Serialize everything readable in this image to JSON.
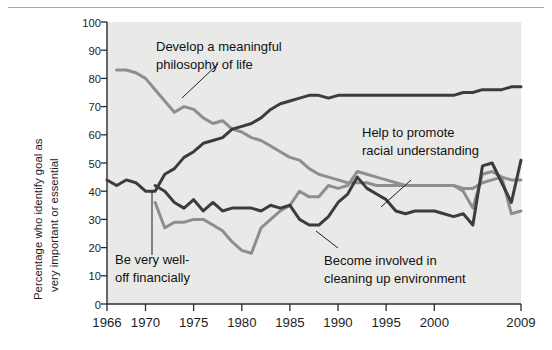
{
  "chart_data": {
    "type": "line",
    "title": "",
    "xlabel": "",
    "ylabel": "Percentage who identify goal as very important or essential",
    "ylabel_line1": "Percentage who identify goal as",
    "ylabel_line2": "very important or essential",
    "xlim": [
      1966,
      2009
    ],
    "ylim": [
      0,
      100
    ],
    "grid": false,
    "legend_position": "inline-annotations",
    "y_ticks": [
      "0",
      "10",
      "20",
      "30",
      "40",
      "50",
      "60",
      "70",
      "80",
      "90",
      "100"
    ],
    "y_tick_values": [
      0,
      10,
      20,
      30,
      40,
      50,
      60,
      70,
      80,
      90,
      100
    ],
    "x_ticks": [
      "1966",
      "1970",
      "1975",
      "1980",
      "1985",
      "1990",
      "1995",
      "2000",
      "2009"
    ],
    "x_tick_values": [
      1966,
      1970,
      1975,
      1980,
      1985,
      1990,
      1995,
      2000,
      2009
    ],
    "series": [
      {
        "name": "Develop a meaningful philosophy of life",
        "color": "#8e8e8e",
        "x": [
          1967,
          1968,
          1969,
          1970,
          1971,
          1972,
          1973,
          1974,
          1975,
          1976,
          1977,
          1978,
          1979,
          1980,
          1981,
          1982,
          1983,
          1984,
          1985,
          1986,
          1987,
          1988,
          1989,
          1990,
          1991,
          1992,
          1993,
          1994,
          1995,
          1996,
          1997,
          1998,
          1999,
          2000,
          2001,
          2002,
          2003,
          2004,
          2005,
          2006,
          2007,
          2008,
          2009
        ],
        "values": [
          83,
          83,
          82,
          80,
          76,
          72,
          68,
          70,
          69,
          66,
          64,
          65,
          62,
          61,
          59,
          58,
          56,
          54,
          52,
          51,
          48,
          46,
          45,
          44,
          43,
          43,
          43,
          42,
          42,
          42,
          42,
          42,
          42,
          42,
          42,
          42,
          41,
          41,
          43,
          44,
          45,
          44,
          44
        ]
      },
      {
        "name": "Be very well-off financially",
        "color": "#3c3c3c",
        "x": [
          1966,
          1967,
          1968,
          1969,
          1970,
          1971,
          1972,
          1973,
          1974,
          1975,
          1976,
          1977,
          1978,
          1979,
          1980,
          1981,
          1982,
          1983,
          1984,
          1985,
          1986,
          1987,
          1988,
          1989,
          1990,
          1991,
          1992,
          1993,
          1994,
          1995,
          1996,
          1997,
          1998,
          1999,
          2000,
          2001,
          2002,
          2003,
          2004,
          2005,
          2006,
          2007,
          2008,
          2009
        ],
        "values": [
          44,
          42,
          44,
          43,
          40,
          40,
          46,
          48,
          52,
          54,
          57,
          58,
          59,
          62,
          63,
          64,
          66,
          69,
          71,
          72,
          73,
          74,
          74,
          73,
          74,
          74,
          74,
          74,
          74,
          74,
          74,
          74,
          74,
          74,
          74,
          74,
          74,
          75,
          75,
          76,
          76,
          76,
          77,
          77
        ]
      },
      {
        "name": "Help to promote racial understanding",
        "color": "#8e8e8e",
        "x": [
          1971,
          1972,
          1973,
          1974,
          1975,
          1976,
          1977,
          1978,
          1979,
          1980,
          1981,
          1982,
          1983,
          1984,
          1985,
          1986,
          1987,
          1988,
          1989,
          1990,
          1991,
          1992,
          1993,
          1994,
          1995,
          1996,
          1997,
          1998,
          1999,
          2000,
          2001,
          2002,
          2003,
          2004,
          2005,
          2006,
          2007,
          2008,
          2009
        ],
        "values": [
          36,
          27,
          29,
          29,
          30,
          30,
          28,
          26,
          22,
          19,
          18,
          27,
          30,
          33,
          35,
          40,
          38,
          38,
          42,
          41,
          42,
          47,
          46,
          45,
          44,
          43,
          42,
          42,
          42,
          42,
          42,
          42,
          40,
          34,
          46,
          47,
          45,
          32,
          33
        ]
      },
      {
        "name": "Become involved in cleaning up environment",
        "color": "#3c3c3c",
        "x": [
          1971,
          1972,
          1973,
          1974,
          1975,
          1976,
          1977,
          1978,
          1979,
          1980,
          1981,
          1982,
          1983,
          1984,
          1985,
          1986,
          1987,
          1988,
          1989,
          1990,
          1991,
          1992,
          1993,
          1994,
          1995,
          1996,
          1997,
          1998,
          1999,
          2000,
          2001,
          2002,
          2003,
          2004,
          2005,
          2006,
          2007,
          2008,
          2009
        ],
        "values": [
          42,
          40,
          36,
          34,
          37,
          33,
          36,
          33,
          34,
          34,
          34,
          33,
          35,
          34,
          35,
          30,
          28,
          28,
          31,
          36,
          39,
          45,
          41,
          39,
          37,
          33,
          32,
          33,
          33,
          33,
          32,
          31,
          32,
          28,
          49,
          50,
          43,
          36,
          51
        ]
      }
    ],
    "annotations": [
      {
        "id": "annot-philosophy",
        "line1": "Develop a meaningful",
        "line2": "philosophy of life",
        "target_series": "Develop a meaningful philosophy of life"
      },
      {
        "id": "annot-financial",
        "line1": "Be very well-",
        "line2": "off financially",
        "target_series": "Be very well-off financially"
      },
      {
        "id": "annot-racial",
        "line1": "Help to promote",
        "line2": "racial understanding",
        "target_series": "Help to promote racial understanding"
      },
      {
        "id": "annot-environment",
        "line1": "Become involved in",
        "line2": "cleaning up environment",
        "target_series": "Become involved in cleaning up environment"
      }
    ]
  }
}
